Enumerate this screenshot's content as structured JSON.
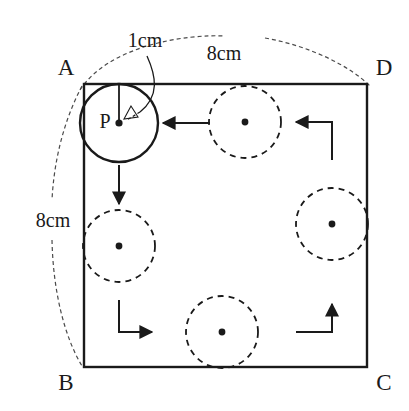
{
  "figure": {
    "square": {
      "vertices": [
        {
          "name": "A",
          "label": "A",
          "x": 84,
          "y": 84
        },
        {
          "name": "D",
          "label": "D",
          "x": 367,
          "y": 84
        },
        {
          "name": "B",
          "label": "B",
          "x": 84,
          "y": 367
        },
        {
          "name": "C",
          "label": "C",
          "x": 367,
          "y": 367
        }
      ],
      "side_length_cm": 8,
      "stroke_color": "#1a1a1a"
    },
    "dimensions": [
      {
        "name": "top-side-dimension",
        "label": "8cm",
        "value": 8,
        "unit": "cm",
        "measures": "AD",
        "label_x": 224,
        "label_y": 55
      },
      {
        "name": "left-side-dimension",
        "label": "8cm",
        "value": 8,
        "unit": "cm",
        "measures": "AB",
        "label_x": 52,
        "label_y": 222
      },
      {
        "name": "radius-dimension",
        "label": "1cm",
        "value": 1,
        "unit": "cm",
        "measures": "radius of circle P",
        "label_x": 145,
        "label_y": 42
      }
    ],
    "solid_circle": {
      "name": "circle-P",
      "label": "P",
      "center_x": 119,
      "center_y": 123,
      "radius": 39,
      "style": "solid",
      "label_x": 104,
      "label_y": 123
    },
    "dashed_circles": [
      {
        "name": "circle-top",
        "center_x": 245,
        "center_y": 122,
        "radius": 36,
        "style": "dashed"
      },
      {
        "name": "circle-left",
        "center_x": 119,
        "center_y": 246,
        "radius": 36,
        "style": "dashed"
      },
      {
        "name": "circle-right",
        "center_x": 332,
        "center_y": 224,
        "radius": 36,
        "style": "dashed"
      },
      {
        "name": "circle-bottom",
        "center_x": 222,
        "center_y": 332,
        "radius": 36,
        "style": "dashed"
      }
    ],
    "motion_arrows": [
      {
        "name": "arrow-left-to-P",
        "direction": "left",
        "path": "M 210 123 L 161 123"
      },
      {
        "name": "arrow-down-from-P",
        "direction": "down",
        "path": "M 119 165 L 119 206"
      },
      {
        "name": "arrow-elbow-top-right",
        "direction": "left",
        "path": "M 332 160 L 332 122 L 294 122"
      },
      {
        "name": "arrow-elbow-bottom-left",
        "direction": "right",
        "path": "M 119 300 L 119 332 L 154 332"
      },
      {
        "name": "arrow-elbow-bottom-right",
        "direction": "up",
        "path": "M 296 332 L 332 332 L 332 302"
      }
    ],
    "colors": {
      "ink": "#1a1a1a",
      "background": "#ffffff"
    }
  }
}
